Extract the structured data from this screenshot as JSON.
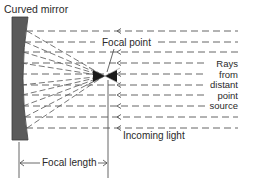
{
  "diagram": {
    "title": "Curved mirror",
    "labels": {
      "focal_point": "Focal point",
      "rays_source": [
        "Rays",
        "from",
        "distant",
        "point",
        "source"
      ],
      "incoming_light": "Incoming light",
      "focal_length": "Focal length"
    },
    "elements": {
      "mirror": "curved-mirror",
      "incoming_rays_count": 10,
      "reflected_rays_converge_at": "focal-point"
    },
    "colors": {
      "mirror_fill": "#555555",
      "line": "#4a4a4a",
      "text": "#2a2a2a",
      "background": "#ffffff"
    }
  }
}
